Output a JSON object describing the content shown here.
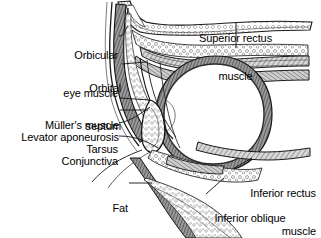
{
  "figure": {
    "background_color": "#ffffff",
    "ink_color": "#000000",
    "style": "grayscale anatomical line engraving"
  },
  "labels": [
    {
      "id": "orbicular-eye-muscle",
      "line1": "Orbicular",
      "line2": "eye muscle",
      "align": "right",
      "x": 46,
      "y": 24,
      "width": 72
    },
    {
      "id": "orbital-septum",
      "line1": "Orbital",
      "line2": "septum",
      "align": "right",
      "x": 68,
      "y": 57,
      "width": 53
    },
    {
      "id": "mullers-muscle",
      "line1": "Müller's muscle",
      "line2": "",
      "align": "right",
      "x": 36,
      "y": 94,
      "width": 83
    },
    {
      "id": "levator-aponeurosis",
      "line1": "Levator aponeurosis",
      "line2": "",
      "align": "right",
      "x": 10,
      "y": 106,
      "width": 109
    },
    {
      "id": "tarsus",
      "line1": "Tarsus",
      "line2": "",
      "align": "right",
      "x": 77,
      "y": 119,
      "width": 41
    },
    {
      "id": "conjunctiva",
      "line1": "Conjunctiva",
      "line2": "",
      "align": "right",
      "x": 53,
      "y": 131,
      "width": 65
    },
    {
      "id": "fat",
      "line1": "Fat",
      "line2": "",
      "align": "right",
      "x": 110,
      "y": 177,
      "width": 18
    },
    {
      "id": "superior-rectus-muscle",
      "line1": "Superior rectus",
      "line2": "muscle",
      "align": "center",
      "x": 190,
      "y": 7,
      "width": 91
    },
    {
      "id": "inferior-rectus-muscle",
      "line1": "Inferior rectus",
      "line2": "muscle",
      "align": "right",
      "x": 236,
      "y": 162,
      "width": 80
    },
    {
      "id": "inferior-oblique-muscle",
      "line1": "Inferior oblique",
      "line2": "muscle",
      "align": "center",
      "x": 205,
      "y": 187,
      "width": 90
    }
  ],
  "anatomy_parts": [
    "orbital bone",
    "globe",
    "superior rectus muscle",
    "inferior rectus muscle",
    "inferior oblique muscle",
    "orbital fat",
    "tarsal plate",
    "levator aponeurosis",
    "Müller's muscle",
    "conjunctiva",
    "orbital septum",
    "orbicularis oculi muscle"
  ]
}
